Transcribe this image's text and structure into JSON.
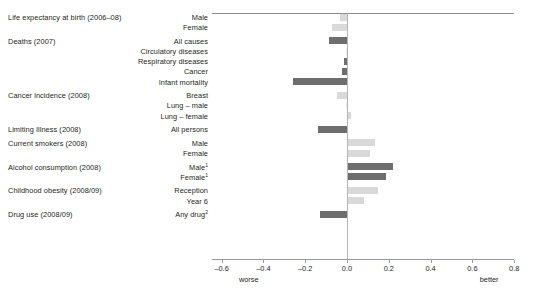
{
  "chart_data": {
    "type": "bar",
    "orientation": "horizontal",
    "title": "",
    "xlabel": "",
    "ylabel": "",
    "xlim": [
      -0.6,
      0.8
    ],
    "xticks": [
      "-0.6",
      "-0.4",
      "-0.2",
      "0.0",
      "0.2",
      "0.4",
      "0.6",
      "0.8"
    ],
    "xtick_values": [
      -0.6,
      -0.4,
      -0.2,
      0.0,
      0.2,
      0.4,
      0.6,
      0.8
    ],
    "grid": false,
    "legend": null,
    "axis_end_labels": {
      "left": "worse",
      "right": "better"
    },
    "groups": [
      {
        "label": "Life expectancy at birth (2006–08)",
        "rows": [
          {
            "category": "Male",
            "value": -0.035,
            "shade": "light"
          },
          {
            "category": "Female",
            "value": -0.07,
            "shade": "light"
          }
        ]
      },
      {
        "label": "Deaths (2007)",
        "rows": [
          {
            "category": "All causes",
            "value": -0.085,
            "shade": "dark"
          },
          {
            "category": "Circulatory diseases",
            "value": -0.005,
            "shade": "vlight"
          },
          {
            "category": "Respiratory diseases",
            "value": -0.015,
            "shade": "dark"
          },
          {
            "category": "Cancer",
            "value": -0.025,
            "shade": "dark"
          },
          {
            "category": "Infant mortality",
            "value": -0.26,
            "shade": "dark"
          }
        ]
      },
      {
        "label": "Cancer incidence (2008)",
        "rows": [
          {
            "category": "Breast",
            "value": -0.05,
            "shade": "light"
          },
          {
            "category": "Lung – male",
            "value": -0.005,
            "shade": "vlight"
          },
          {
            "category": "Lung – female",
            "value": 0.02,
            "shade": "light"
          }
        ]
      },
      {
        "label": "Limiting Illness (2008)",
        "rows": [
          {
            "category": "All persons",
            "value": -0.14,
            "shade": "dark"
          }
        ]
      },
      {
        "label": "Current smokers (2008)",
        "rows": [
          {
            "category": "Male",
            "value": 0.135,
            "shade": "light"
          },
          {
            "category": "Female",
            "value": 0.11,
            "shade": "light"
          }
        ]
      },
      {
        "label": "Alcohol consumption (2008)",
        "rows": [
          {
            "category": "Male",
            "superscript": "1",
            "value": 0.22,
            "shade": "dark"
          },
          {
            "category": "Female",
            "superscript": "1",
            "value": 0.185,
            "shade": "dark"
          }
        ]
      },
      {
        "label": "Childhood obesity (2008/09)",
        "rows": [
          {
            "category": "Reception",
            "value": 0.15,
            "shade": "light"
          },
          {
            "category": "Year 6",
            "value": 0.08,
            "shade": "light"
          }
        ]
      },
      {
        "label": "Drug use (2008/09)",
        "rows": [
          {
            "category": "Any drug",
            "superscript": "2",
            "value": -0.13,
            "shade": "dark"
          }
        ]
      }
    ],
    "colors": {
      "dark": "#6e6e6e",
      "light": "#d9d9d9",
      "vlight": "#eaeaea",
      "axis": "#9a9a9a",
      "zero_line": "#b5b5b5",
      "text": "#231f20"
    }
  }
}
